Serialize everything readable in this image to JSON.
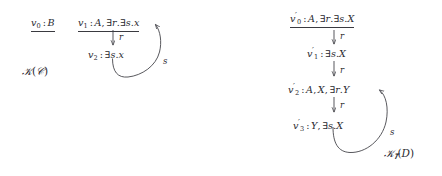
{
  "figure": {
    "kind": "two-labelled-graphs",
    "stroke_color": "#3a3a40",
    "text_color": "#2a2a30",
    "background": "#ffffff"
  },
  "left_graph": {
    "caption": "G(C)",
    "caption_script": "G",
    "caption_arg": "C",
    "nodes": [
      {
        "id": "v0",
        "name": "v",
        "index": "0",
        "prime": "",
        "label": "v₀ : B",
        "types": "B",
        "underlined": true
      },
      {
        "id": "v1",
        "name": "v",
        "index": "1",
        "prime": "",
        "label": "v₁ : A, ∃r.∃s.x",
        "types": "A, ∃r.∃s.x",
        "underlined": true
      },
      {
        "id": "v2",
        "name": "v",
        "index": "2",
        "prime": "",
        "label": "v₂ : ∃s.x",
        "types": "∃s.x",
        "underlined": false
      }
    ],
    "edges": [
      {
        "from": "v1",
        "to": "v2",
        "label": "r",
        "shape": "straight-down"
      },
      {
        "from": "v2",
        "to": "v1",
        "label": "s",
        "shape": "curved-back"
      }
    ]
  },
  "right_graph": {
    "caption": "G_T(D)",
    "caption_script": "G",
    "caption_sub": "T",
    "caption_arg": "D",
    "nodes": [
      {
        "id": "v0p",
        "name": "v",
        "index": "0",
        "prime": "′",
        "label": "v′₀ : A, ∃r.∃s.X",
        "types": "A, ∃r.∃s.X",
        "underlined": true
      },
      {
        "id": "v1p",
        "name": "v",
        "index": "1",
        "prime": "′",
        "label": "v′₁ : ∃s.X",
        "types": "∃s.X",
        "underlined": false
      },
      {
        "id": "v2p",
        "name": "v",
        "index": "2",
        "prime": "′",
        "label": "v′₂ : A, X, ∃r.Y",
        "types": "A, X, ∃r.Y",
        "underlined": false
      },
      {
        "id": "v3p",
        "name": "v",
        "index": "3",
        "prime": "′",
        "label": "v′₃ : Y, ∃s.X",
        "types": "Y, ∃s.X",
        "underlined": false
      }
    ],
    "edges": [
      {
        "from": "v0p",
        "to": "v1p",
        "label": "r",
        "shape": "straight-down"
      },
      {
        "from": "v1p",
        "to": "v2p",
        "label": "r",
        "shape": "straight-down"
      },
      {
        "from": "v2p",
        "to": "v3p",
        "label": "r",
        "shape": "straight-down"
      },
      {
        "from": "v3p",
        "to": "v2p",
        "label": "s",
        "shape": "curved-back"
      }
    ]
  },
  "symbols": {
    "exists": "∃",
    "colon": ":",
    "comma": ",",
    "dot": "."
  }
}
